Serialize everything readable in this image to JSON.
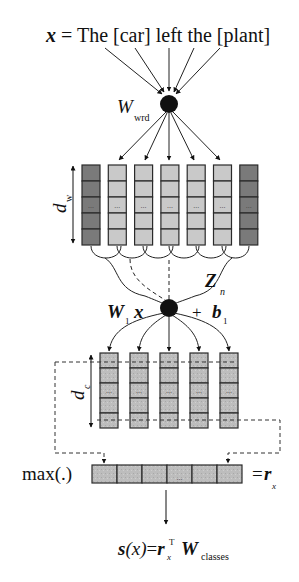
{
  "diagram": {
    "input_sentence": {
      "var": "x",
      "equals": " = ",
      "text": "The [car] left the [plant]"
    },
    "word_weight": {
      "symbol": "W",
      "subscript": "wrd"
    },
    "word_embedding_dim": {
      "symbol": "d",
      "subscript": "w"
    },
    "word_columns": {
      "count": 7,
      "cells_per_column": 5,
      "ellipsis": "...",
      "padding_columns": [
        0,
        6
      ],
      "colors": {
        "padding": "#7a7a7a",
        "word": "#c9c9c9",
        "border": "#2a2a2a"
      }
    },
    "window_label": {
      "symbol": "Z",
      "subscript": "n"
    },
    "conv": {
      "weight_symbol": "W",
      "weight_subscript": "1",
      "input_symbol": "x",
      "plus": "+",
      "bias_symbol": "b",
      "bias_subscript": "1"
    },
    "conv_embedding_dim": {
      "symbol": "d",
      "subscript": "c"
    },
    "conv_columns": {
      "count": 5,
      "cells_per_column": 5,
      "ellipsis": "...",
      "color": "#b8b8b8"
    },
    "pooling": {
      "label": "max(.)",
      "cells": 6,
      "ellipsis": "...",
      "result_equals": "=",
      "result_symbol": "r",
      "result_subscript": "x"
    },
    "score": {
      "lhs_func": "s",
      "lhs_arg": "(x)",
      "equals": "=",
      "r_symbol": "r",
      "r_subscript": "x",
      "r_superscript": "T",
      "w_symbol": "W",
      "w_subscript": "classes"
    }
  }
}
